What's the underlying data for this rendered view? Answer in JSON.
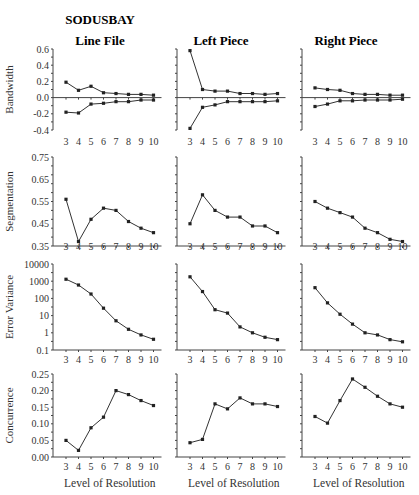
{
  "figure": {
    "title": "SODUSBAY",
    "columns": [
      "Line File",
      "Left Piece",
      "Right Piece"
    ],
    "rows": [
      "Bandwidth",
      "Segmentation",
      "Error Variance",
      "Concurrence"
    ],
    "xlabel": "Level of Resolution"
  },
  "chart_data": [
    {
      "type": "line",
      "title": "Line File",
      "row": "Bandwidth",
      "xlabel": "",
      "ylabel": "Bandwidth",
      "x": [
        3,
        4,
        5,
        6,
        7,
        8,
        9,
        10
      ],
      "ylim": [
        -0.4,
        0.6
      ],
      "yticks": [
        "0.6",
        "0.4",
        "0.2",
        "0.0",
        "-0.2",
        "-0.4"
      ],
      "series": [
        {
          "name": "upper",
          "values": [
            0.19,
            0.09,
            0.14,
            0.06,
            0.05,
            0.04,
            0.04,
            0.03
          ]
        },
        {
          "name": "lower",
          "values": [
            -0.18,
            -0.19,
            -0.08,
            -0.07,
            -0.05,
            -0.05,
            -0.03,
            -0.03
          ]
        }
      ]
    },
    {
      "type": "line",
      "title": "Left Piece",
      "row": "Bandwidth",
      "x": [
        3,
        4,
        5,
        6,
        7,
        8,
        9,
        10
      ],
      "ylim": [
        -0.4,
        0.6
      ],
      "series": [
        {
          "name": "upper",
          "values": [
            0.58,
            0.1,
            0.08,
            0.08,
            0.05,
            0.05,
            0.04,
            0.05
          ]
        },
        {
          "name": "lower",
          "values": [
            -0.38,
            -0.12,
            -0.09,
            -0.05,
            -0.05,
            -0.05,
            -0.05,
            -0.04
          ]
        }
      ]
    },
    {
      "type": "line",
      "title": "Right Piece",
      "row": "Bandwidth",
      "x": [
        3,
        4,
        5,
        6,
        7,
        8,
        9,
        10
      ],
      "ylim": [
        -0.4,
        0.6
      ],
      "series": [
        {
          "name": "upper",
          "values": [
            0.12,
            0.1,
            0.09,
            0.05,
            0.04,
            0.04,
            0.03,
            0.03
          ]
        },
        {
          "name": "lower",
          "values": [
            -0.11,
            -0.08,
            -0.04,
            -0.04,
            -0.03,
            -0.03,
            -0.03,
            -0.02
          ]
        }
      ]
    },
    {
      "type": "line",
      "title": "Line File",
      "row": "Segmentation",
      "ylabel": "Segmentation",
      "x": [
        3,
        4,
        5,
        6,
        7,
        8,
        9,
        10
      ],
      "ylim": [
        0.35,
        0.75
      ],
      "yticks": [
        "0.75",
        "0.65",
        "0.55",
        "0.45",
        "0.35"
      ],
      "series": [
        {
          "name": "segmentation",
          "values": [
            0.56,
            0.37,
            0.47,
            0.52,
            0.51,
            0.46,
            0.43,
            0.41
          ]
        }
      ]
    },
    {
      "type": "line",
      "title": "Left Piece",
      "row": "Segmentation",
      "x": [
        3,
        4,
        5,
        6,
        7,
        8,
        9,
        10
      ],
      "ylim": [
        0.35,
        0.75
      ],
      "series": [
        {
          "name": "segmentation",
          "values": [
            0.45,
            0.58,
            0.51,
            0.48,
            0.48,
            0.44,
            0.44,
            0.41
          ]
        }
      ]
    },
    {
      "type": "line",
      "title": "Right Piece",
      "row": "Segmentation",
      "x": [
        3,
        4,
        5,
        6,
        7,
        8,
        9,
        10
      ],
      "ylim": [
        0.35,
        0.75
      ],
      "series": [
        {
          "name": "segmentation",
          "values": [
            0.55,
            0.52,
            0.5,
            0.48,
            0.43,
            0.41,
            0.38,
            0.37
          ]
        }
      ]
    },
    {
      "type": "line",
      "title": "Line File",
      "row": "Error Variance",
      "ylabel": "Error Variance",
      "yscale": "log",
      "x": [
        3,
        4,
        5,
        6,
        7,
        8,
        9,
        10
      ],
      "ylim": [
        0.1,
        10000
      ],
      "yticks": [
        "10000",
        "1000",
        "100",
        "10",
        "1",
        "0.1"
      ],
      "series": [
        {
          "name": "error_variance",
          "values": [
            1300,
            600,
            180,
            27,
            5,
            1.6,
            0.75,
            0.42
          ]
        }
      ]
    },
    {
      "type": "line",
      "title": "Left Piece",
      "row": "Error Variance",
      "yscale": "log",
      "x": [
        3,
        4,
        5,
        6,
        7,
        8,
        9,
        10
      ],
      "ylim": [
        0.1,
        10000
      ],
      "series": [
        {
          "name": "error_variance",
          "values": [
            1800,
            250,
            22,
            14,
            2.2,
            1.0,
            0.55,
            0.4
          ]
        }
      ]
    },
    {
      "type": "line",
      "title": "Right Piece",
      "row": "Error Variance",
      "yscale": "log",
      "x": [
        3,
        4,
        5,
        6,
        7,
        8,
        9,
        10
      ],
      "ylim": [
        0.1,
        10000
      ],
      "series": [
        {
          "name": "error_variance",
          "values": [
            420,
            55,
            12,
            3.2,
            1.0,
            0.75,
            0.4,
            0.3
          ]
        }
      ]
    },
    {
      "type": "line",
      "title": "Line File",
      "row": "Concurrence",
      "ylabel": "Concurrence",
      "xlabel": "Level of Resolution",
      "x": [
        3,
        4,
        5,
        6,
        7,
        8,
        9,
        10
      ],
      "ylim": [
        0.0,
        0.25
      ],
      "yticks": [
        "0.25",
        "0.20",
        "0.15",
        "0.10",
        "0.05",
        "0.00"
      ],
      "series": [
        {
          "name": "concurrence",
          "values": [
            0.05,
            0.02,
            0.088,
            0.12,
            0.2,
            0.188,
            0.17,
            0.155
          ]
        }
      ]
    },
    {
      "type": "line",
      "title": "Left Piece",
      "row": "Concurrence",
      "xlabel": "Level of Resolution",
      "x": [
        3,
        4,
        5,
        6,
        7,
        8,
        9,
        10
      ],
      "ylim": [
        0.0,
        0.25
      ],
      "series": [
        {
          "name": "concurrence",
          "values": [
            0.043,
            0.053,
            0.16,
            0.145,
            0.178,
            0.16,
            0.16,
            0.152
          ]
        }
      ]
    },
    {
      "type": "line",
      "title": "Right Piece",
      "row": "Concurrence",
      "xlabel": "Level of Resolution",
      "x": [
        3,
        4,
        5,
        6,
        7,
        8,
        9,
        10
      ],
      "ylim": [
        0.0,
        0.25
      ],
      "series": [
        {
          "name": "concurrence",
          "values": [
            0.122,
            0.102,
            0.17,
            0.235,
            0.21,
            0.183,
            0.16,
            0.15
          ]
        }
      ]
    }
  ]
}
